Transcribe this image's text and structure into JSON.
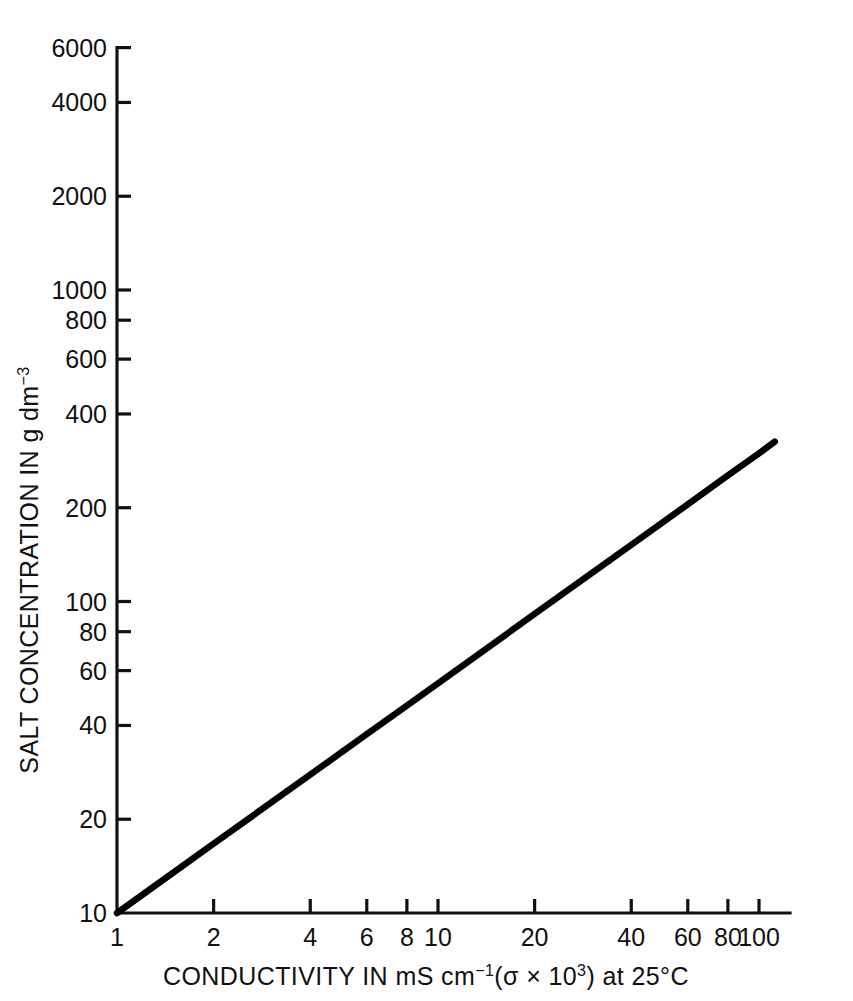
{
  "chart_data": {
    "type": "line",
    "title": "",
    "xlabel": "CONDUCTIVITY IN mS cm⁻¹(σ × 10³) at 25°C",
    "ylabel": "SALT CONCENTRATION IN g  dm⁻³",
    "xscale": "log",
    "yscale": "log",
    "xlim": [
      1,
      130
    ],
    "ylim": [
      10,
      6000
    ],
    "grid": false,
    "legend": null,
    "xticks": [
      {
        "value": 1,
        "label": "1"
      },
      {
        "value": 2,
        "label": "2"
      },
      {
        "value": 4,
        "label": "4"
      },
      {
        "value": 6,
        "label": "6"
      },
      {
        "value": 8,
        "label": "8"
      },
      {
        "value": 10,
        "label": "10"
      },
      {
        "value": 20,
        "label": "20"
      },
      {
        "value": 40,
        "label": "40"
      },
      {
        "value": 60,
        "label": "60"
      },
      {
        "value": 80,
        "label": "80"
      },
      {
        "value": 100,
        "label": "100"
      }
    ],
    "yticks": [
      {
        "value": 10,
        "label": "10"
      },
      {
        "value": 20,
        "label": "20"
      },
      {
        "value": 40,
        "label": "40"
      },
      {
        "value": 60,
        "label": "60"
      },
      {
        "value": 80,
        "label": "80"
      },
      {
        "value": 100,
        "label": "100"
      },
      {
        "value": 200,
        "label": "200"
      },
      {
        "value": 400,
        "label": "400"
      },
      {
        "value": 600,
        "label": "600"
      },
      {
        "value": 800,
        "label": "800"
      },
      {
        "value": 1000,
        "label": "1000"
      },
      {
        "value": 2000,
        "label": "2000"
      },
      {
        "value": 4000,
        "label": "4000"
      },
      {
        "value": 6000,
        "label": "6000"
      }
    ],
    "series": [
      {
        "name": "salt concentration vs conductivity",
        "color": "#000000",
        "x": [
          1,
          2,
          4,
          6,
          8,
          10,
          20,
          40,
          60,
          80,
          100,
          112
        ],
        "y": [
          10,
          16.7,
          27.8,
          37.5,
          46.3,
          54.6,
          91.2,
          152,
          205,
          254,
          299,
          326
        ]
      }
    ]
  },
  "axis_title_parts": {
    "x_main": "CONDUCTIVITY IN mS cm",
    "x_sup1": "−1",
    "x_mid": "(σ × 10",
    "x_sup2": "3",
    "x_tail": ") at 25°C",
    "y_main": "SALT CONCENTRATION IN g  dm",
    "y_sup": "−3"
  }
}
